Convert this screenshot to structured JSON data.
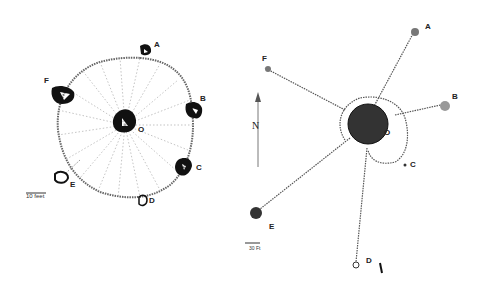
{
  "left_diagram": {
    "center_label": "O",
    "nodes": [
      {
        "id": "A",
        "label": "A"
      },
      {
        "id": "B",
        "label": "B"
      },
      {
        "id": "C",
        "label": "C"
      },
      {
        "id": "D",
        "label": "D"
      },
      {
        "id": "E",
        "label": "E"
      },
      {
        "id": "F",
        "label": "F"
      }
    ],
    "scale_label": "10 feet"
  },
  "right_diagram": {
    "center_label": "O",
    "nodes": [
      {
        "id": "A",
        "label": "A"
      },
      {
        "id": "B",
        "label": "B"
      },
      {
        "id": "C",
        "label": "C"
      },
      {
        "id": "D",
        "label": "D"
      },
      {
        "id": "E",
        "label": "E"
      },
      {
        "id": "F",
        "label": "F"
      }
    ],
    "north_label": "N",
    "scale_label": "30 Ft"
  }
}
